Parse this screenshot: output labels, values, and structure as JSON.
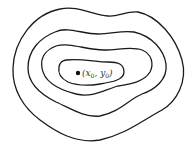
{
  "diagram": {
    "type": "contour-map",
    "level_curves": 4,
    "point": {
      "label_open": "(",
      "x_symbol": "x",
      "x_sub": "0",
      "sep": ", ",
      "y_symbol": "y",
      "y_sub": "0",
      "label_close": ")",
      "full_label": "(x0, y0)"
    },
    "colors": {
      "stroke": "#1a1a1a",
      "background": "#ffffff"
    }
  }
}
